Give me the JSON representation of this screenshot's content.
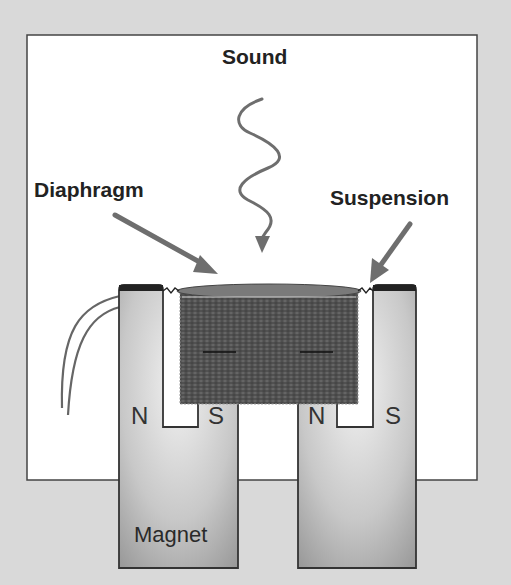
{
  "diagram": {
    "title_label": "Sound",
    "labels": {
      "diaphragm": "Diaphragm",
      "suspension": "Suspension",
      "magnet": "Magnet"
    },
    "poles": {
      "left_outer": "N",
      "left_inner": "S",
      "right_inner": "N",
      "right_outer": "S"
    },
    "colors": {
      "background": "#d9d9d9",
      "panel": "#ffffff",
      "magnet_light": "#e6e6e6",
      "magnet_dark": "#9a9a9a",
      "coil": "#5a5a5a",
      "arrow": "#6e6e6e",
      "outline": "#333333"
    }
  }
}
